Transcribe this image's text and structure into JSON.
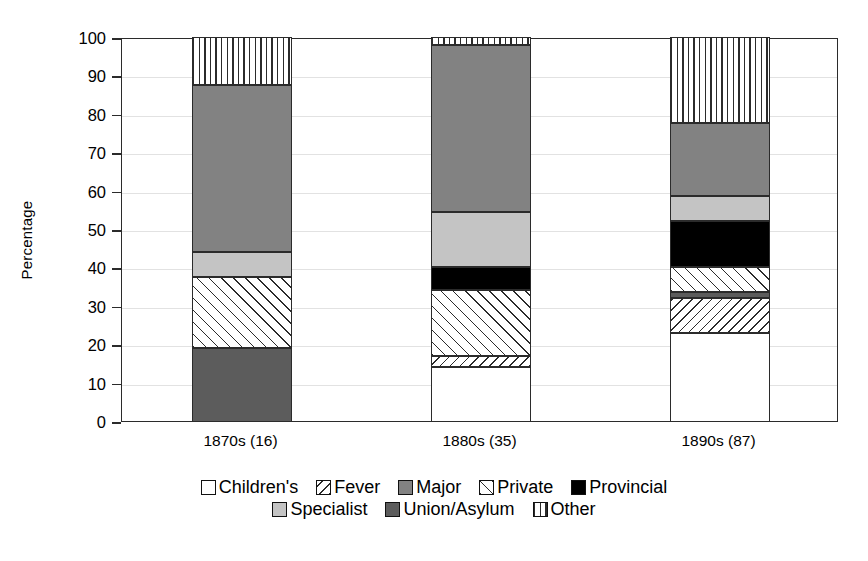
{
  "chart_data": {
    "type": "bar",
    "subtype": "stacked-bar-100-percent",
    "title": "",
    "xlabel": "",
    "ylabel": "Percentage",
    "ylim": [
      0,
      100
    ],
    "yticks": [
      0,
      10,
      20,
      30,
      40,
      50,
      60,
      70,
      80,
      90,
      100
    ],
    "ytick_labels": [
      "0",
      "10",
      "20",
      "30",
      "40",
      "50",
      "60",
      "70",
      "80",
      "90",
      "100"
    ],
    "grid": true,
    "legend_position": "bottom",
    "categories": [
      "1870s (16)",
      "1880s (35)",
      "1890s (87)"
    ],
    "series": [
      {
        "name": "Children's",
        "key": "childrens",
        "pattern": "solid-white",
        "color": "#ffffff",
        "values": [
          0,
          14,
          23
        ]
      },
      {
        "name": "Fever",
        "key": "fever",
        "pattern": "back-diagonal-hatch",
        "color": "#ffffff",
        "values": [
          0,
          3,
          9
        ]
      },
      {
        "name": "Major",
        "key": "major",
        "pattern": "solid-medium-gray",
        "color": "#828282",
        "values": [
          43.5,
          43.5,
          19
        ]
      },
      {
        "name": "Private",
        "key": "private",
        "pattern": "forward-diagonal-hatch",
        "color": "#ffffff",
        "values": [
          18.5,
          17,
          6.5
        ]
      },
      {
        "name": "Provincial",
        "key": "provincial",
        "pattern": "solid-black",
        "color": "#000000",
        "values": [
          0,
          6,
          12
        ]
      },
      {
        "name": "Specialist",
        "key": "specialist",
        "pattern": "solid-light-gray",
        "color": "#c4c4c4",
        "values": [
          6.5,
          14.5,
          6.5
        ]
      },
      {
        "name": "Union/Asylum",
        "key": "union_asylum",
        "pattern": "solid-dark-gray",
        "color": "#5c5c5c",
        "values": [
          19,
          0,
          1.5
        ]
      },
      {
        "name": "Other",
        "key": "other",
        "pattern": "vertical-line-hatch",
        "color": "#ffffff",
        "values": [
          12.5,
          2,
          22.5
        ]
      }
    ],
    "stacks": [
      {
        "category": "1870s (16)",
        "segments": [
          {
            "name": "Union/Asylum",
            "pattern": "solid-dark-gray",
            "start": 0,
            "end": 19,
            "value": 19
          },
          {
            "name": "Private",
            "pattern": "forward-diagonal-hatch",
            "start": 19,
            "end": 37.5,
            "value": 18.5
          },
          {
            "name": "Specialist",
            "pattern": "solid-light-gray",
            "start": 37.5,
            "end": 44,
            "value": 6.5
          },
          {
            "name": "Major",
            "pattern": "solid-medium-gray",
            "start": 44,
            "end": 87.5,
            "value": 43.5
          },
          {
            "name": "Other",
            "pattern": "vertical-line-hatch",
            "start": 87.5,
            "end": 100,
            "value": 12.5
          }
        ]
      },
      {
        "category": "1880s (35)",
        "segments": [
          {
            "name": "Children's",
            "pattern": "solid-white",
            "start": 0,
            "end": 14,
            "value": 14
          },
          {
            "name": "Fever",
            "pattern": "back-diagonal-hatch",
            "start": 14,
            "end": 17,
            "value": 3
          },
          {
            "name": "Private",
            "pattern": "forward-diagonal-hatch",
            "start": 17,
            "end": 34,
            "value": 17
          },
          {
            "name": "Provincial",
            "pattern": "solid-black",
            "start": 34,
            "end": 40,
            "value": 6
          },
          {
            "name": "Specialist",
            "pattern": "solid-light-gray",
            "start": 40,
            "end": 54.5,
            "value": 14.5
          },
          {
            "name": "Major",
            "pattern": "solid-medium-gray",
            "start": 54.5,
            "end": 98,
            "value": 43.5
          },
          {
            "name": "Other",
            "pattern": "vertical-line-hatch",
            "start": 98,
            "end": 100,
            "value": 2
          }
        ]
      },
      {
        "category": "1890s (87)",
        "segments": [
          {
            "name": "Children's",
            "pattern": "solid-white",
            "start": 0,
            "end": 23,
            "value": 23
          },
          {
            "name": "Fever",
            "pattern": "back-diagonal-hatch",
            "start": 23,
            "end": 32,
            "value": 9
          },
          {
            "name": "Union/Asylum",
            "pattern": "solid-dark-gray",
            "start": 32,
            "end": 33.5,
            "value": 1.5
          },
          {
            "name": "Private",
            "pattern": "forward-diagonal-hatch",
            "start": 33.5,
            "end": 40,
            "value": 6.5
          },
          {
            "name": "Provincial",
            "pattern": "solid-black",
            "start": 40,
            "end": 52,
            "value": 12
          },
          {
            "name": "Specialist",
            "pattern": "solid-light-gray",
            "start": 52,
            "end": 58.5,
            "value": 6.5
          },
          {
            "name": "Major",
            "pattern": "solid-medium-gray",
            "start": 58.5,
            "end": 77.5,
            "value": 19
          },
          {
            "name": "Other",
            "pattern": "vertical-line-hatch",
            "start": 77.5,
            "end": 100,
            "value": 22.5
          }
        ]
      }
    ],
    "legend": {
      "rows": [
        [
          {
            "label": "Children's",
            "pattern": "solid-white"
          },
          {
            "label": "Fever",
            "pattern": "back-diagonal-hatch"
          },
          {
            "label": "Major",
            "pattern": "solid-medium-gray"
          },
          {
            "label": "Private",
            "pattern": "forward-diagonal-hatch"
          },
          {
            "label": "Provincial",
            "pattern": "solid-black"
          }
        ],
        [
          {
            "label": "Specialist",
            "pattern": "solid-light-gray"
          },
          {
            "label": "Union/Asylum",
            "pattern": "solid-dark-gray"
          },
          {
            "label": "Other",
            "pattern": "vertical-line-hatch"
          }
        ]
      ]
    }
  }
}
